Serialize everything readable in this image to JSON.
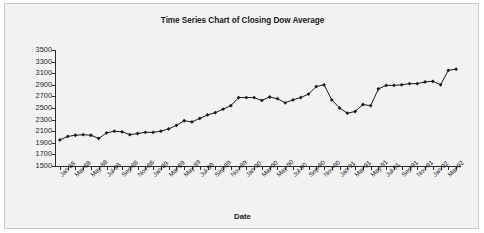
{
  "chart": {
    "title": "Time Series Chart of Closing Dow Average",
    "xlabel": "Date",
    "ylabel": "",
    "frame_bg": "#f2f2f2",
    "series_color": "#1a1a1a"
  },
  "chart_data": {
    "type": "line",
    "title": "Time Series Chart of Closing Dow Average",
    "xlabel": "Date",
    "ylabel": "",
    "ylim": [
      1500,
      3500
    ],
    "ytick_labels": [
      "3500",
      "3300",
      "3100",
      "2900",
      "2700",
      "2500",
      "2300",
      "2100",
      "1900",
      "1700",
      "1500"
    ],
    "ytick_values": [
      3500,
      3300,
      3100,
      2900,
      2700,
      2500,
      2300,
      2100,
      1900,
      1700,
      1500
    ],
    "grid": false,
    "legend": "none",
    "marker": "diamond",
    "xtick_labels": [
      "Jan-88",
      "Mar-88",
      "May-88",
      "Jul-88",
      "Sep-88",
      "Nov-88",
      "Jan-89",
      "Mar-89",
      "May-89",
      "Jul-89",
      "Sep-89",
      "Nov-89",
      "Jan-90",
      "Mar-90",
      "May-90",
      "Jul-90",
      "Sep-90",
      "Nov-90",
      "Jan-91",
      "Mar-91",
      "May-91",
      "Jul-91",
      "Sep-91",
      "Nov-91",
      "Jan-92",
      "Mar-92"
    ],
    "x": [
      "Jan-88",
      "Feb-88",
      "Mar-88",
      "Apr-88",
      "May-88",
      "Jun-88",
      "Jul-88",
      "Aug-88",
      "Sep-88",
      "Oct-88",
      "Nov-88",
      "Dec-88",
      "Jan-89",
      "Feb-89",
      "Mar-89",
      "Apr-89",
      "May-89",
      "Jun-89",
      "Jul-89",
      "Aug-89",
      "Sep-89",
      "Oct-89",
      "Nov-89",
      "Dec-89",
      "Jan-90",
      "Feb-90",
      "Mar-90",
      "Apr-90",
      "May-90",
      "Jun-90",
      "Jul-90",
      "Aug-90",
      "Sep-90",
      "Oct-90",
      "Nov-90",
      "Dec-90",
      "Jan-91",
      "Feb-91",
      "Mar-91",
      "Apr-91",
      "May-91",
      "Jun-91",
      "Jul-91",
      "Aug-91",
      "Sep-91",
      "Oct-91",
      "Nov-91",
      "Dec-91",
      "Jan-92",
      "Feb-92",
      "Mar-92",
      "Apr-92"
    ],
    "values": [
      1950,
      2010,
      2030,
      2040,
      2030,
      1975,
      2070,
      2100,
      2090,
      2040,
      2060,
      2080,
      2080,
      2100,
      2140,
      2200,
      2280,
      2260,
      2320,
      2380,
      2420,
      2480,
      2540,
      2680,
      2680,
      2680,
      2630,
      2690,
      2660,
      2590,
      2640,
      2680,
      2740,
      2870,
      2900,
      2640,
      2500,
      2410,
      2440,
      2560,
      2540,
      2830,
      2890,
      2890,
      2900,
      2920,
      2920,
      2950,
      2960,
      2900,
      3150,
      3170
    ]
  }
}
